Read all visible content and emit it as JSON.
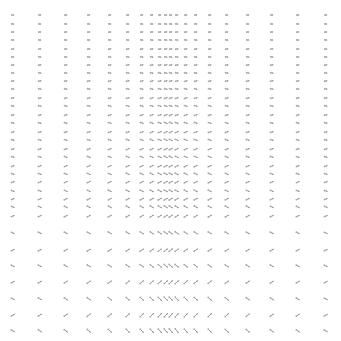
{
  "chart_data": {
    "type": "quiver",
    "title": "",
    "xlabel": "",
    "ylabel": "",
    "axes_visible": false,
    "grid": false,
    "legend": null,
    "arrow_color": "#9a9a9a",
    "x": [
      13,
      40,
      66,
      89,
      110,
      128,
      142,
      152,
      160,
      166,
      171,
      177,
      186,
      196,
      210,
      227,
      248,
      272,
      298,
      326
    ],
    "y": [
      15,
      24,
      32,
      40,
      49,
      57,
      65,
      73,
      81,
      89,
      98,
      106,
      115,
      123,
      132,
      140,
      149,
      157,
      166,
      174,
      182,
      191,
      199,
      207,
      216,
      233,
      250,
      266,
      282,
      299,
      315,
      331
    ],
    "direction_notes": "Short arrows pointing mostly right in the upper rows; progressively rotating toward diagonal up-right / down-right pairs in the lower rows; arrows longer near the central dense columns at the bottom."
  }
}
